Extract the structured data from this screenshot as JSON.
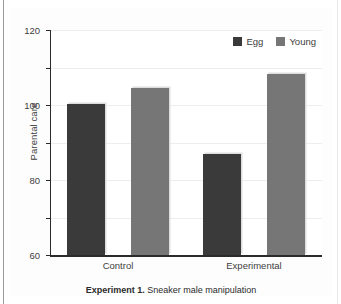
{
  "figure": {
    "caption_label": "Experiment 1.",
    "caption_text": " Sneaker male manipulation"
  },
  "chart_data": {
    "type": "bar",
    "title": "",
    "xlabel": "",
    "ylabel": "Parental care",
    "categories": [
      "Control",
      "Experimental"
    ],
    "series": [
      {
        "name": "Egg",
        "values": [
          80.5,
          54
        ],
        "color": "#3a3a3a"
      },
      {
        "name": "Young",
        "values": [
          89,
          96.5
        ],
        "color": "#767676"
      }
    ],
    "ylim": [
      0,
      120
    ],
    "yticks": [
      0,
      20,
      40,
      60,
      80,
      100,
      120
    ],
    "ytick_labels": [
      "0",
      "20",
      "40",
      "60",
      "80",
      "100",
      "120"
    ],
    "grid": true,
    "legend_position": "top-right"
  }
}
